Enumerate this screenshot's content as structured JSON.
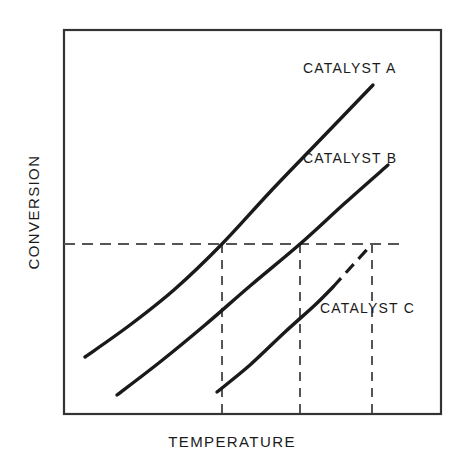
{
  "figure": {
    "background_color": "#ffffff",
    "line_color": "#1a1a1a",
    "frame_color": "#333333"
  },
  "axes": {
    "x_title": "TEMPERATURE",
    "y_title": "CONVERSION"
  },
  "labels": {
    "catalyst_a": "CATALYST A",
    "catalyst_b": "CATALYST B",
    "catalyst_c": "CATALYST C"
  },
  "chart_data": {
    "type": "line",
    "title": "",
    "xlabel": "TEMPERATURE",
    "ylabel": "CONVERSION",
    "xlim": [
      0,
      1
    ],
    "ylim": [
      0,
      1
    ],
    "grid": false,
    "axis_ticks": false,
    "axis_tick_labels": false,
    "legend": "inline-labels",
    "series": [
      {
        "name": "CATALYST A",
        "label_position": {
          "x": 303,
          "y": 60
        },
        "style": "solid",
        "points_px": [
          [
            85,
            357
          ],
          [
            130,
            325
          ],
          [
            175,
            289
          ],
          [
            222,
            244
          ],
          [
            270,
            192
          ],
          [
            320,
            140
          ],
          [
            373,
            85
          ]
        ],
        "x": [
          0.056,
          0.175,
          0.295,
          0.419,
          0.546,
          0.679,
          0.82
        ],
        "y": [
          0.149,
          0.232,
          0.326,
          0.443,
          0.578,
          0.714,
          0.857
        ]
      },
      {
        "name": "CATALYST B",
        "label_position": {
          "x": 303,
          "y": 150
        },
        "style": "solid",
        "points_px": [
          [
            117,
            395
          ],
          [
            160,
            362
          ],
          [
            205,
            325
          ],
          [
            250,
            286
          ],
          [
            300,
            244
          ],
          [
            345,
            203
          ],
          [
            388,
            165
          ]
        ],
        "x": [
          0.141,
          0.255,
          0.374,
          0.493,
          0.626,
          0.745,
          0.859
        ],
        "y": [
          0.049,
          0.135,
          0.232,
          0.333,
          0.443,
          0.549,
          0.648
        ]
      },
      {
        "name": "CATALYST C",
        "label_position": {
          "x": 320,
          "y": 300
        },
        "style": "solid-then-dashed",
        "dash_start_px": [
          333,
          287
        ],
        "points_px": [
          [
            217,
            392
          ],
          [
            250,
            365
          ],
          [
            285,
            332
          ],
          [
            315,
            305
          ],
          [
            333,
            287
          ],
          [
            352,
            266
          ],
          [
            371,
            245
          ]
        ],
        "x": [
          0.406,
          0.493,
          0.586,
          0.666,
          0.714,
          0.764,
          0.814
        ],
        "y": [
          0.057,
          0.128,
          0.214,
          0.284,
          0.331,
          0.385,
          0.44
        ]
      }
    ],
    "reference_line": {
      "orientation": "horizontal",
      "style": "dashed",
      "y_px": 244,
      "y": 0.443,
      "x_start_px": 64,
      "x_end_px": 403,
      "note": "common conversion level"
    },
    "droplines": [
      {
        "series": "CATALYST A",
        "style": "dashed",
        "x_px": 222,
        "x": 0.419,
        "y_top_px": 244,
        "y_bottom_px": 414
      },
      {
        "series": "CATALYST B",
        "style": "dashed",
        "x_px": 300,
        "x": 0.626,
        "y_top_px": 244,
        "y_bottom_px": 414
      },
      {
        "series": "CATALYST C",
        "style": "dashed",
        "x_px": 372,
        "x": 0.817,
        "y_top_px": 244,
        "y_bottom_px": 414
      }
    ],
    "plot_frame_px": {
      "left": 64,
      "top": 30,
      "right": 441,
      "bottom": 414
    }
  }
}
